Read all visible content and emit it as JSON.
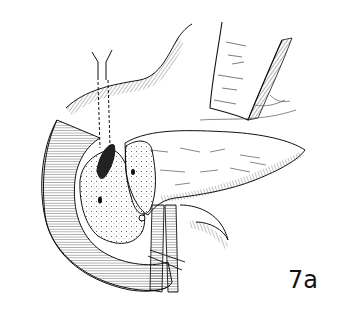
{
  "figure": {
    "label": "7a",
    "ink_color": "#111111",
    "background_color": "#ffffff"
  }
}
